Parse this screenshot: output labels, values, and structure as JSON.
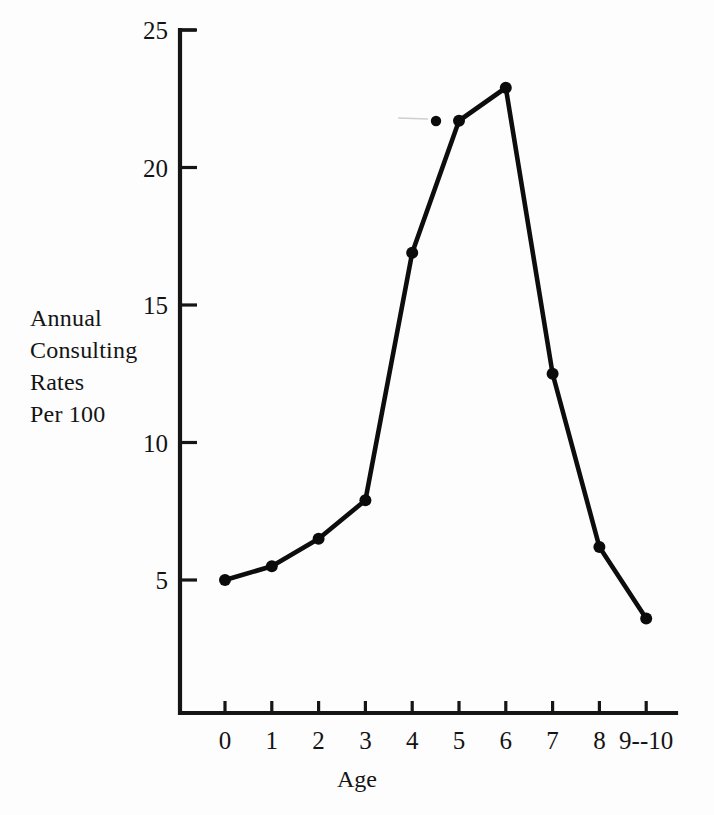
{
  "chart_data": {
    "type": "line",
    "title": "",
    "subtitle": "",
    "xlabel": "Age",
    "ylabel": "Annual Consulting Rates Per 100",
    "ylabel_lines": [
      "Annual",
      "Consulting",
      "Rates",
      "Per 100"
    ],
    "x": [
      0,
      1,
      2,
      3,
      4,
      5,
      6,
      7,
      8,
      9
    ],
    "categories": [
      "0",
      "1",
      "2",
      "3",
      "4",
      "5",
      "6",
      "7",
      "8",
      "9--10"
    ],
    "values": [
      5.0,
      5.5,
      6.5,
      7.9,
      16.9,
      21.7,
      22.9,
      12.5,
      6.2,
      3.6
    ],
    "series": [
      {
        "name": "Annual Consulting Rates Per 100",
        "values": [
          5.0,
          5.5,
          6.5,
          7.9,
          16.9,
          21.7,
          22.9,
          12.5,
          6.2,
          3.6
        ]
      }
    ],
    "xtick_labels": [
      "0",
      "1",
      "2",
      "3",
      "4",
      "5",
      "6",
      "7",
      "8",
      "9--10"
    ],
    "ytick_labels": [
      "5",
      "10",
      "15",
      "20",
      "25"
    ],
    "ytick_values": [
      5,
      10,
      15,
      20,
      25
    ],
    "ylim": [
      0,
      25
    ],
    "xlim": [
      -0.45,
      9.65
    ],
    "grid": false,
    "legend": false,
    "legend_position": "none",
    "marker": "filled-circle",
    "line_color": "#0d0d0d",
    "marker_color": "#0b0b0b",
    "axis_color": "#151515",
    "background_color": "#fdfdfd",
    "annotations": [
      {
        "name": "stray-ink-dot",
        "x": 4.5,
        "y": 22.0,
        "note": "isolated printing artifact dot between x=4 and x=5"
      }
    ]
  },
  "axes": {
    "y_axis_name": "vertical-axis",
    "x_axis_name": "horizontal-axis"
  }
}
